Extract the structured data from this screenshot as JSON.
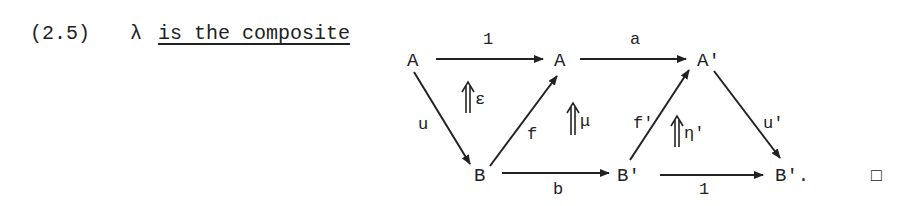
{
  "statement": {
    "number": "(2.5)",
    "symbol": "λ",
    "text": "is the composite"
  },
  "diagram": {
    "nodes": {
      "top_left": "A",
      "top_middle": "A",
      "top_right": "A'",
      "bottom_left": "B",
      "bottom_middle": "B'",
      "bottom_right": "B'."
    },
    "arrows": {
      "top_left_to_top_middle": "1",
      "top_middle_to_top_right": "a",
      "top_left_to_bottom_left": "u",
      "bottom_left_to_top_middle": "f",
      "bottom_middle_to_top_right": "f'",
      "top_right_to_bottom_right": "u'",
      "bottom_left_to_bottom_middle": "b",
      "bottom_middle_to_bottom_right": "1"
    },
    "two_cells": {
      "epsilon": "ε",
      "mu": "μ",
      "eta_prime": "η'"
    }
  },
  "end_mark": "□"
}
